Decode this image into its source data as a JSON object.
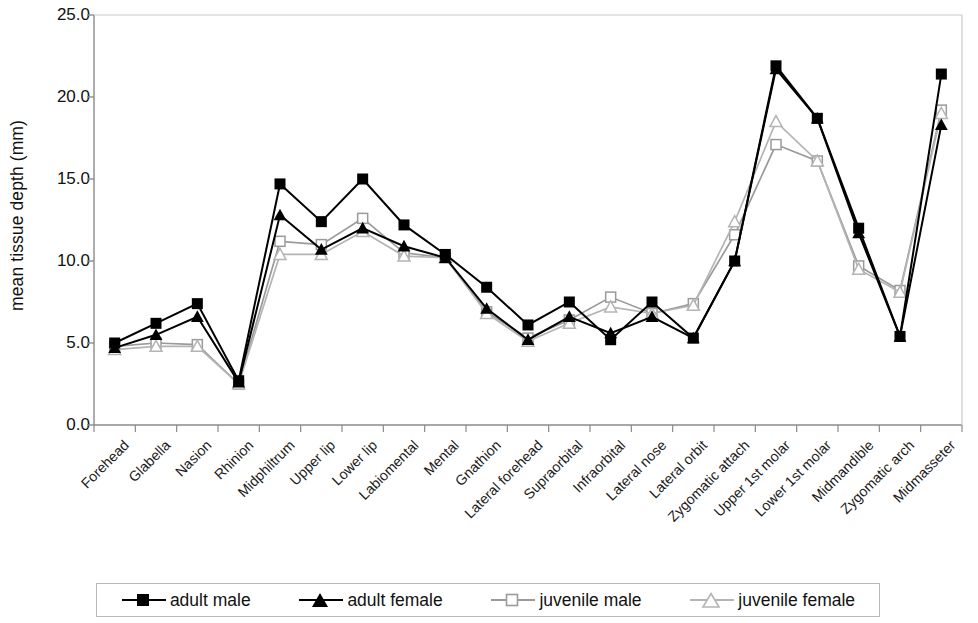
{
  "chart_data": {
    "type": "line",
    "title": "",
    "xlabel": "",
    "ylabel": "mean tissue depth (mm)",
    "ylim": [
      0.0,
      25.0
    ],
    "yticks": [
      "0.0",
      "5.0",
      "10.0",
      "15.0",
      "20.0",
      "25.0"
    ],
    "ytick_values": [
      0.0,
      5.0,
      10.0,
      15.0,
      20.0,
      25.0
    ],
    "grid": false,
    "legend_position": "bottom",
    "categories": [
      "Forehead",
      "Glabella",
      "Nasion",
      "Rhinion",
      "Midphiltrum",
      "Upper lip",
      "Lower lip",
      "Labiomental",
      "Mental",
      "Gnathion",
      "Lateral forehead",
      "Supraorbital",
      "Infraorbital",
      "Lateral nose",
      "Lateral orbit",
      "Zygomatic attach",
      "Upper 1st molar",
      "Lower 1st molar",
      "Midmandible",
      "Zygomatic arch",
      "Midmasseter"
    ],
    "series": [
      {
        "name": "adult male",
        "marker": "filled-square",
        "color": "#000000",
        "values": [
          5.0,
          6.2,
          7.4,
          2.7,
          14.7,
          12.4,
          15.0,
          12.2,
          10.4,
          8.4,
          6.1,
          7.5,
          5.2,
          7.5,
          5.3,
          10.0,
          21.9,
          18.7,
          12.0,
          5.4,
          21.4
        ]
      },
      {
        "name": "adult female",
        "marker": "filled-triangle",
        "color": "#000000",
        "values": [
          4.7,
          5.5,
          6.6,
          2.6,
          12.8,
          10.7,
          12.0,
          10.9,
          10.2,
          7.1,
          5.2,
          6.6,
          5.6,
          6.6,
          5.3,
          10.0,
          21.7,
          18.7,
          11.7,
          5.4,
          18.3
        ]
      },
      {
        "name": "juvenile male",
        "marker": "open-square",
        "color": "#9a9a9a",
        "values": [
          4.8,
          5.0,
          4.9,
          2.5,
          11.2,
          11.0,
          12.6,
          10.5,
          10.2,
          6.9,
          5.3,
          6.4,
          7.8,
          6.8,
          7.4,
          11.6,
          17.1,
          16.1,
          9.7,
          8.2,
          19.2
        ]
      },
      {
        "name": "juvenile female",
        "marker": "open-triangle",
        "color": "#b4b4b4",
        "values": [
          4.6,
          4.8,
          4.8,
          2.5,
          10.4,
          10.4,
          11.8,
          10.3,
          10.2,
          6.8,
          5.1,
          6.2,
          7.2,
          6.8,
          7.3,
          12.4,
          18.5,
          16.1,
          9.5,
          8.1,
          19.0
        ]
      }
    ]
  },
  "legend": {
    "items": [
      {
        "label": "adult male"
      },
      {
        "label": "adult female"
      },
      {
        "label": "juvenile male"
      },
      {
        "label": "juvenile female"
      }
    ]
  },
  "colors": {
    "adult": "#000000",
    "juvenile_male": "#9a9a9a",
    "juvenile_female": "#b4b4b4",
    "axis": "#8a8a8a"
  }
}
